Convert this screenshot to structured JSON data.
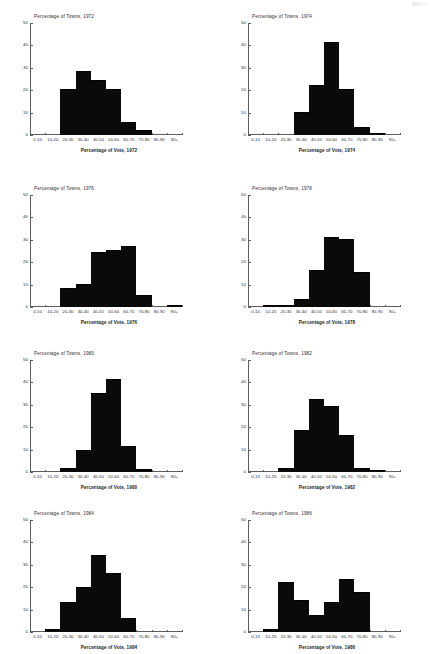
{
  "figure": {
    "axis_color": "#5d5d5d",
    "bar_color": "#0a0a0a",
    "y_ticks": [
      0,
      10,
      20,
      30,
      40,
      50
    ],
    "x_categories": [
      "0-10",
      "10-20",
      "20-30",
      "30-40",
      "40-50",
      "50-60",
      "60-70",
      "70-80",
      "80-90",
      "90+"
    ]
  },
  "chart_data": [
    {
      "type": "bar",
      "title": "Percentage of Towns, 1972",
      "xlabel": "Percentage of Vote, 1972",
      "ylabel": "Percentage of Towns, 1972",
      "categories": [
        "0-10",
        "10-20",
        "20-30",
        "30-40",
        "40-50",
        "50-60",
        "60-70",
        "70-80",
        "80-90",
        "90+"
      ],
      "values": [
        0,
        0,
        20,
        28,
        24,
        20,
        5.5,
        2,
        0,
        0
      ],
      "ylim": [
        0,
        50
      ],
      "xlim": [
        0,
        10
      ],
      "grid": false,
      "legend": "none"
    },
    {
      "type": "bar",
      "title": "Percentage of Towns, 1974",
      "xlabel": "Percentage of Vote, 1974",
      "ylabel": "Percentage of Towns, 1974",
      "categories": [
        "0-10",
        "10-20",
        "20-30",
        "30-40",
        "40-50",
        "50-60",
        "60-70",
        "70-80",
        "80-90",
        "90+"
      ],
      "values": [
        0,
        0,
        0,
        10,
        22,
        41,
        20,
        3,
        0.5,
        0
      ],
      "ylim": [
        0,
        50
      ],
      "xlim": [
        0,
        10
      ],
      "grid": false,
      "legend": "none"
    },
    {
      "type": "bar",
      "title": "Percentage of Towns, 1976",
      "xlabel": "Percentage of Vote, 1976",
      "ylabel": "Percentage of Towns, 1976",
      "categories": [
        "0-10",
        "10-20",
        "20-30",
        "30-40",
        "40-50",
        "50-60",
        "60-70",
        "70-80",
        "80-90",
        "90+"
      ],
      "values": [
        0,
        0,
        8,
        10,
        24,
        25,
        27,
        5,
        0,
        0.6
      ],
      "ylim": [
        0,
        50
      ],
      "xlim": [
        0,
        10
      ],
      "grid": false,
      "legend": "none"
    },
    {
      "type": "bar",
      "title": "Percentage of Towns, 1978",
      "xlabel": "Percentage of Vote, 1978",
      "ylabel": "Percentage of Towns, 1978",
      "categories": [
        "0-10",
        "10-20",
        "20-30",
        "30-40",
        "40-50",
        "50-60",
        "60-70",
        "70-80",
        "80-90",
        "90+"
      ],
      "values": [
        0,
        0.6,
        0.5,
        3,
        16,
        31,
        30,
        15,
        0,
        0
      ],
      "ylim": [
        0,
        50
      ],
      "xlim": [
        0,
        10
      ],
      "grid": false,
      "legend": "none"
    },
    {
      "type": "bar",
      "title": "Percentage of Towns, 1980",
      "xlabel": "Percentage of Vote, 1980",
      "ylabel": "Percentage of Towns, 1980",
      "categories": [
        "0-10",
        "10-20",
        "20-30",
        "30-40",
        "40-50",
        "50-60",
        "60-70",
        "70-80",
        "80-90",
        "90+"
      ],
      "values": [
        0,
        0,
        1.5,
        9.5,
        35,
        41,
        11,
        0.7,
        0,
        0
      ],
      "ylim": [
        0,
        50
      ],
      "xlim": [
        0,
        10
      ],
      "grid": false,
      "legend": "none"
    },
    {
      "type": "bar",
      "title": "Percentage of Towns, 1982",
      "xlabel": "Percentage of Vote, 1982",
      "ylabel": "Percentage of Towns, 1982",
      "categories": [
        "0-10",
        "10-20",
        "20-30",
        "30-40",
        "40-50",
        "50-60",
        "60-70",
        "70-80",
        "80-90",
        "90+"
      ],
      "values": [
        0,
        0,
        1.5,
        18.5,
        32,
        29,
        16,
        1.3,
        0.6,
        0
      ],
      "ylim": [
        0,
        50
      ],
      "xlim": [
        0,
        10
      ],
      "grid": false,
      "legend": "none"
    },
    {
      "type": "bar",
      "title": "Percentage of Towns, 1984",
      "xlabel": "Percentage of Vote, 1984",
      "ylabel": "Percentage of Towns, 1984",
      "categories": [
        "0-10",
        "10-20",
        "20-30",
        "30-40",
        "40-50",
        "50-60",
        "60-70",
        "70-80",
        "80-90",
        "90+"
      ],
      "values": [
        0,
        0.7,
        13,
        19.5,
        34,
        26,
        6,
        0,
        0,
        0
      ],
      "ylim": [
        0,
        50
      ],
      "xlim": [
        0,
        10
      ],
      "grid": false,
      "legend": "none"
    },
    {
      "type": "bar",
      "title": "Percentage of Towns, 1986",
      "xlabel": "Percentage of Vote, 1986",
      "ylabel": "Percentage of Towns, 1986",
      "categories": [
        "0-10",
        "10-20",
        "20-30",
        "30-40",
        "40-50",
        "50-60",
        "60-70",
        "70-80",
        "80-90",
        "90+"
      ],
      "values": [
        0,
        0.7,
        22,
        14,
        7,
        13,
        23,
        17.5,
        0,
        0
      ],
      "ylim": [
        0,
        50
      ],
      "xlim": [
        0,
        10
      ],
      "grid": false,
      "legend": "none"
    }
  ]
}
